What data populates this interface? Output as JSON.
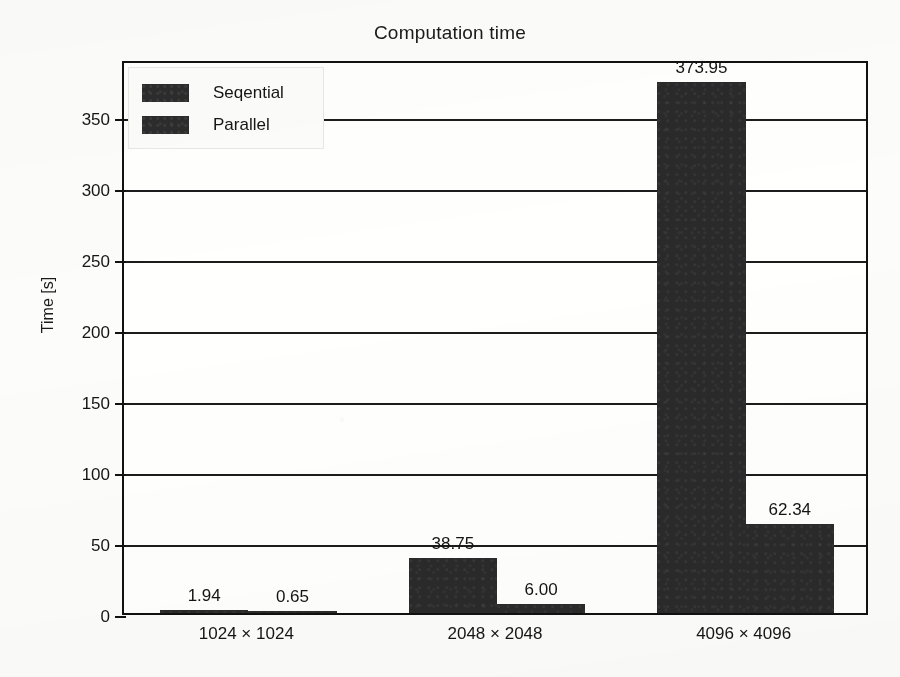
{
  "chart_data": {
    "type": "bar",
    "title": "Computation time",
    "xlabel": "",
    "ylabel": "Time [s]",
    "categories": [
      "1024 × 1024",
      "2048 × 2048",
      "4096 × 4096"
    ],
    "series": [
      {
        "name": "Seqential",
        "values": [
          1.94,
          38.75,
          373.95
        ],
        "color": "#2a2a2a"
      },
      {
        "name": "Parallel",
        "values": [
          0.65,
          6.0,
          62.34
        ],
        "color": "#2a2a2a"
      }
    ],
    "value_labels": {
      "Seqential": [
        "1.94",
        "38.75",
        "373.95"
      ],
      "Parallel": [
        "0.65",
        "6.00",
        "62.34"
      ]
    },
    "ylim": [
      0,
      390
    ],
    "yticks": [
      0,
      50,
      100,
      150,
      200,
      250,
      300,
      350
    ],
    "ytick_labels": [
      "0",
      "50",
      "100",
      "150",
      "200",
      "250",
      "300",
      "350"
    ],
    "grid": "horizontal",
    "legend_position": "upper left",
    "bar_style": "grouped-adjacent"
  },
  "axes": {
    "y_title": "Time [s]",
    "tick_labels": [
      "350",
      "300",
      "250",
      "200",
      "150",
      "100",
      "50",
      "0"
    ]
  },
  "legend": {
    "entries": [
      {
        "label": "Seqential"
      },
      {
        "label": "Parallel"
      }
    ]
  },
  "bars": [
    {
      "value_label": "1.94",
      "series": "Seqential",
      "category": "1024 × 1024"
    },
    {
      "value_label": "0.65",
      "series": "Parallel",
      "category": "1024 × 1024"
    },
    {
      "value_label": "38.75",
      "series": "Seqential",
      "category": "2048 × 2048"
    },
    {
      "value_label": "6.00",
      "series": "Parallel",
      "category": "2048 × 2048"
    },
    {
      "value_label": "373.95",
      "series": "Seqential",
      "category": "4096 × 4096"
    },
    {
      "value_label": "62.34",
      "series": "Parallel",
      "category": "4096 × 4096"
    }
  ],
  "categories": [
    "1024 × 1024",
    "2048 × 2048",
    "4096 × 4096"
  ]
}
